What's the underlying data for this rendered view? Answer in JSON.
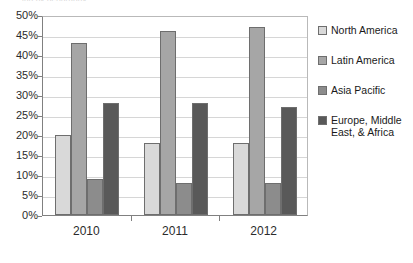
{
  "title_sliver": "ing by geography",
  "legend": {
    "position": "right",
    "items": [
      {
        "label": "North America",
        "color": "#d9d9d9"
      },
      {
        "label": "Latin America",
        "color": "#a6a6a6"
      },
      {
        "label": "Asia Pacific",
        "color": "#8c8c8c"
      },
      {
        "label": "Europe, Middle\nEast, & Africa",
        "color": "#595959"
      }
    ]
  },
  "axis": {
    "y_ticks": [
      "0%",
      "5%",
      "10%",
      "15%",
      "20%",
      "25%",
      "30%",
      "35%",
      "40%",
      "45%",
      "50%"
    ],
    "x_ticks": [
      "2010",
      "2011",
      "2012"
    ]
  },
  "chart_data": {
    "type": "bar",
    "title": "",
    "xlabel": "",
    "ylabel": "",
    "ylim": [
      0,
      50
    ],
    "ytick_step": 5,
    "yunit": "%",
    "grid": true,
    "legend_position": "right",
    "categories": [
      "2010",
      "2011",
      "2012"
    ],
    "series": [
      {
        "name": "North America",
        "color": "#d9d9d9",
        "values": [
          20,
          18,
          18
        ]
      },
      {
        "name": "Latin America",
        "color": "#a6a6a6",
        "values": [
          43,
          46,
          47
        ]
      },
      {
        "name": "Asia Pacific",
        "color": "#8c8c8c",
        "values": [
          9,
          8,
          8
        ]
      },
      {
        "name": "Europe, Middle East, & Africa",
        "color": "#595959",
        "values": [
          28,
          28,
          27
        ]
      }
    ]
  }
}
